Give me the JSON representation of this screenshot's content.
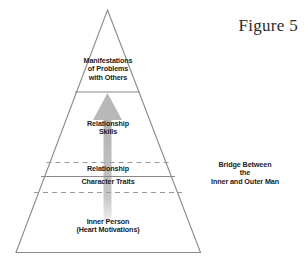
{
  "figure": {
    "title": "Figure 5"
  },
  "pyramid": {
    "levels": [
      {
        "id": "manifestations",
        "label": "Manifestations\nof Problems\nwith Others"
      },
      {
        "id": "relationship-skills",
        "label": "Relationship\nSkills"
      },
      {
        "id": "relationship",
        "label": "Relationship"
      },
      {
        "id": "character-traits",
        "label": "Character Traits"
      },
      {
        "id": "inner-person",
        "label": "Inner Person\n(Heart Motivations)"
      }
    ]
  },
  "annotations": {
    "bridge": "Bridge Between\nthe\nInner and Outer Man"
  },
  "colors": {
    "outline": "#8a8a8a",
    "divider_solid": "#8a8a8a",
    "divider_dashed": "#9a9a9a",
    "arrow": "#b3b3b3",
    "text": "#1b1b1b",
    "title_text": "#2a2a2a",
    "background": "#ffffff"
  },
  "icons": {
    "arrow": "upward-arrow-icon",
    "pyramid": "pyramid-outline-icon"
  }
}
